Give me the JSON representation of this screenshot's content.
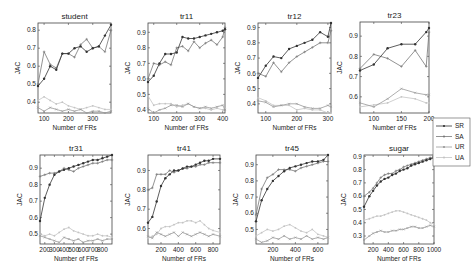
{
  "figure": {
    "series_names": [
      "SR",
      "SA",
      "UR",
      "UA"
    ],
    "series_colors": {
      "SR": "#333333",
      "SA": "#777777",
      "UR": "#999999",
      "UA": "#c4c4c4"
    },
    "xlabel": "Number of FRs",
    "ylabel": "JAC"
  },
  "legend": {
    "items": [
      "SR",
      "SA",
      "UR",
      "UA"
    ]
  },
  "chart_data": [
    {
      "type": "line",
      "title": "student",
      "xlabel": "Number of FRs",
      "ylabel": "JAC",
      "xlim": [
        75,
        375
      ],
      "ylim": [
        0.34,
        0.84
      ],
      "xticks": [
        100,
        200,
        300
      ],
      "yticks": [
        0.4,
        0.5,
        0.6,
        0.7,
        0.8
      ],
      "x": [
        75,
        100,
        125,
        150,
        175,
        200,
        225,
        250,
        275,
        300,
        325,
        350,
        375
      ],
      "series": [
        {
          "name": "SR",
          "values": [
            0.49,
            0.53,
            0.6,
            0.58,
            0.67,
            0.67,
            0.7,
            0.71,
            0.68,
            0.7,
            0.71,
            0.77,
            0.83
          ]
        },
        {
          "name": "SA",
          "values": [
            0.5,
            0.68,
            0.61,
            0.59,
            0.67,
            0.67,
            0.65,
            0.72,
            0.75,
            0.7,
            0.71,
            0.68,
            0.8
          ]
        },
        {
          "name": "UR",
          "values": [
            0.37,
            0.35,
            0.37,
            0.36,
            0.35,
            0.36,
            0.35,
            0.36,
            0.34,
            0.35,
            0.35,
            0.34,
            0.35
          ]
        },
        {
          "name": "UA",
          "values": [
            0.41,
            0.43,
            0.41,
            0.39,
            0.4,
            0.38,
            0.37,
            0.36,
            0.37,
            0.38,
            0.37,
            0.36,
            0.36
          ]
        }
      ]
    },
    {
      "type": "line",
      "title": "tr11",
      "xlabel": "Number of FRs",
      "ylabel": "JAC",
      "xlim": [
        75,
        410
      ],
      "ylim": [
        0.38,
        0.96
      ],
      "xticks": [
        100,
        200,
        300,
        400
      ],
      "yticks": [
        0.4,
        0.5,
        0.6,
        0.7,
        0.8,
        0.9
      ],
      "x": [
        75,
        100,
        125,
        150,
        175,
        200,
        225,
        250,
        275,
        300,
        325,
        350,
        375,
        400,
        410
      ],
      "series": [
        {
          "name": "SR",
          "values": [
            0.58,
            0.62,
            0.7,
            0.76,
            0.76,
            0.77,
            0.87,
            0.86,
            0.86,
            0.87,
            0.88,
            0.89,
            0.9,
            0.91,
            0.92
          ]
        },
        {
          "name": "SA",
          "values": [
            0.6,
            0.7,
            0.69,
            0.71,
            0.69,
            0.8,
            0.81,
            0.78,
            0.84,
            0.8,
            0.83,
            0.85,
            0.82,
            0.87,
            0.93
          ]
        },
        {
          "name": "UR",
          "values": [
            0.41,
            0.38,
            0.4,
            0.41,
            0.43,
            0.43,
            0.42,
            0.44,
            0.42,
            0.41,
            0.42,
            0.41,
            0.42,
            0.43,
            0.4
          ]
        },
        {
          "name": "UA",
          "values": [
            0.49,
            0.43,
            0.44,
            0.44,
            0.44,
            0.42,
            0.43,
            0.44,
            0.42,
            0.41,
            0.41,
            0.4,
            0.41,
            0.4,
            0.41
          ]
        }
      ]
    },
    {
      "type": "line",
      "title": "tr12",
      "xlabel": "Number of FRs",
      "ylabel": "JAC",
      "xlim": [
        75,
        310
      ],
      "ylim": [
        0.34,
        0.93
      ],
      "xticks": [
        100,
        200,
        300
      ],
      "yticks": [
        0.4,
        0.5,
        0.6,
        0.7,
        0.8,
        0.9
      ],
      "x": [
        75,
        100,
        125,
        150,
        175,
        200,
        225,
        250,
        275,
        300,
        310
      ],
      "series": [
        {
          "name": "SR",
          "values": [
            0.57,
            0.65,
            0.71,
            0.7,
            0.76,
            0.78,
            0.8,
            0.82,
            0.87,
            0.84,
            0.93
          ]
        },
        {
          "name": "SA",
          "values": [
            0.6,
            0.58,
            0.67,
            0.61,
            0.67,
            0.71,
            0.74,
            0.77,
            0.8,
            0.8,
            0.88
          ]
        },
        {
          "name": "UR",
          "values": [
            0.42,
            0.41,
            0.38,
            0.39,
            0.4,
            0.4,
            0.38,
            0.37,
            0.37,
            0.39,
            0.38
          ]
        },
        {
          "name": "UA",
          "values": [
            0.44,
            0.42,
            0.39,
            0.39,
            0.39,
            0.36,
            0.37,
            0.36,
            0.36,
            0.34,
            0.34
          ]
        }
      ]
    },
    {
      "type": "line",
      "title": "tr23",
      "xlabel": "Number of FRs",
      "ylabel": "JAC",
      "xlim": [
        75,
        200
      ],
      "ylim": [
        0.52,
        0.97
      ],
      "xticks": [
        100,
        150,
        200
      ],
      "yticks": [
        0.6,
        0.7,
        0.8,
        0.9
      ],
      "x": [
        75,
        100,
        125,
        150,
        175,
        195,
        200
      ],
      "series": [
        {
          "name": "SR",
          "values": [
            0.73,
            0.76,
            0.84,
            0.86,
            0.86,
            0.92,
            0.94
          ]
        },
        {
          "name": "SA",
          "values": [
            0.74,
            0.81,
            0.79,
            0.75,
            0.83,
            0.75,
            0.92
          ]
        },
        {
          "name": "UR",
          "values": [
            0.57,
            0.55,
            0.59,
            0.64,
            0.62,
            0.61,
            0.61
          ]
        },
        {
          "name": "UA",
          "values": [
            0.55,
            0.56,
            0.57,
            0.6,
            0.59,
            0.57,
            0.57
          ]
        }
      ]
    },
    {
      "type": "line",
      "title": "tr31",
      "xlabel": "Number of FRs",
      "ylabel": "JAC",
      "xlim": [
        150,
        900
      ],
      "ylim": [
        0.44,
        0.98
      ],
      "xticks": [
        200,
        300,
        400,
        500,
        600,
        700,
        800
      ],
      "yticks": [
        0.5,
        0.6,
        0.7,
        0.8,
        0.9
      ],
      "x": [
        150,
        200,
        250,
        300,
        350,
        400,
        450,
        500,
        550,
        600,
        650,
        700,
        750,
        800,
        850,
        900
      ],
      "series": [
        {
          "name": "SR",
          "values": [
            0.58,
            0.72,
            0.8,
            0.86,
            0.88,
            0.89,
            0.9,
            0.91,
            0.92,
            0.93,
            0.94,
            0.95,
            0.95,
            0.96,
            0.97,
            0.98
          ]
        },
        {
          "name": "SA",
          "values": [
            0.85,
            0.86,
            0.87,
            0.87,
            0.88,
            0.9,
            0.89,
            0.88,
            0.9,
            0.91,
            0.92,
            0.93,
            0.93,
            0.94,
            0.95,
            0.95
          ]
        },
        {
          "name": "UR",
          "values": [
            0.49,
            0.48,
            0.47,
            0.46,
            0.45,
            0.48,
            0.47,
            0.46,
            0.47,
            0.45,
            0.46,
            0.46,
            0.47,
            0.46,
            0.47,
            0.47
          ]
        },
        {
          "name": "UA",
          "values": [
            0.5,
            0.49,
            0.5,
            0.49,
            0.51,
            0.53,
            0.54,
            0.52,
            0.51,
            0.5,
            0.49,
            0.49,
            0.5,
            0.49,
            0.49,
            0.48
          ]
        }
      ]
    },
    {
      "type": "line",
      "title": "tr41",
      "xlabel": "Number of FRs",
      "ylabel": "JAC",
      "xlim": [
        50,
        880
      ],
      "ylim": [
        0.52,
        0.98
      ],
      "xticks": [
        200,
        400,
        600,
        800
      ],
      "yticks": [
        0.6,
        0.7,
        0.8,
        0.9
      ],
      "x": [
        50,
        100,
        150,
        200,
        250,
        300,
        350,
        400,
        450,
        500,
        550,
        600,
        650,
        700,
        750,
        800,
        880
      ],
      "series": [
        {
          "name": "SR",
          "values": [
            0.63,
            0.66,
            0.74,
            0.82,
            0.86,
            0.88,
            0.9,
            0.9,
            0.91,
            0.92,
            0.92,
            0.93,
            0.94,
            0.95,
            0.95,
            0.96,
            0.96
          ]
        },
        {
          "name": "SA",
          "values": [
            0.8,
            0.81,
            0.88,
            0.88,
            0.88,
            0.9,
            0.89,
            0.9,
            0.91,
            0.91,
            0.92,
            0.92,
            0.93,
            0.93,
            0.94,
            0.94,
            0.94
          ]
        },
        {
          "name": "UR",
          "values": [
            0.56,
            0.55,
            0.58,
            0.57,
            0.56,
            0.57,
            0.58,
            0.56,
            0.58,
            0.57,
            0.56,
            0.57,
            0.58,
            0.57,
            0.56,
            0.57,
            0.56
          ]
        },
        {
          "name": "UA",
          "values": [
            0.55,
            0.56,
            0.57,
            0.6,
            0.61,
            0.61,
            0.62,
            0.63,
            0.63,
            0.64,
            0.64,
            0.63,
            0.64,
            0.62,
            0.6,
            0.59,
            0.58
          ]
        }
      ]
    },
    {
      "type": "line",
      "title": "tr45",
      "xlabel": "Number of FRs",
      "ylabel": "JAC",
      "xlim": [
        50,
        690
      ],
      "ylim": [
        0.41,
        0.96
      ],
      "xticks": [
        200,
        400,
        600
      ],
      "yticks": [
        0.5,
        0.6,
        0.7,
        0.8,
        0.9
      ],
      "x": [
        50,
        100,
        150,
        200,
        250,
        300,
        350,
        400,
        450,
        500,
        550,
        600,
        650,
        690
      ],
      "series": [
        {
          "name": "SR",
          "values": [
            0.55,
            0.68,
            0.75,
            0.8,
            0.83,
            0.86,
            0.88,
            0.89,
            0.9,
            0.91,
            0.92,
            0.92,
            0.93,
            0.96
          ]
        },
        {
          "name": "SA",
          "values": [
            0.59,
            0.75,
            0.82,
            0.84,
            0.87,
            0.87,
            0.87,
            0.86,
            0.88,
            0.89,
            0.9,
            0.91,
            0.92,
            0.92
          ]
        },
        {
          "name": "UR",
          "values": [
            0.44,
            0.42,
            0.43,
            0.45,
            0.44,
            0.46,
            0.44,
            0.45,
            0.44,
            0.46,
            0.44,
            0.45,
            0.44,
            0.45
          ]
        },
        {
          "name": "UA",
          "values": [
            0.46,
            0.48,
            0.5,
            0.49,
            0.5,
            0.52,
            0.53,
            0.51,
            0.49,
            0.48,
            0.5,
            0.47,
            0.46,
            0.45
          ]
        }
      ]
    },
    {
      "type": "line",
      "title": "sugar",
      "xlabel": "Number of FRs",
      "ylabel": "JAC",
      "xlim": [
        80,
        1000
      ],
      "ylim": [
        0.24,
        0.91
      ],
      "xticks": [
        200,
        400,
        600,
        800,
        1000
      ],
      "yticks": [
        0.3,
        0.4,
        0.5,
        0.6,
        0.7,
        0.8,
        0.9
      ],
      "x": [
        80,
        150,
        200,
        250,
        300,
        350,
        400,
        450,
        500,
        550,
        600,
        650,
        700,
        750,
        800,
        850,
        900,
        950,
        1000
      ],
      "series": [
        {
          "name": "SR",
          "values": [
            0.52,
            0.6,
            0.64,
            0.68,
            0.71,
            0.73,
            0.74,
            0.76,
            0.77,
            0.79,
            0.8,
            0.81,
            0.83,
            0.84,
            0.85,
            0.86,
            0.87,
            0.88,
            0.89
          ]
        },
        {
          "name": "SA",
          "values": [
            0.6,
            0.63,
            0.66,
            0.7,
            0.74,
            0.76,
            0.77,
            0.77,
            0.79,
            0.8,
            0.82,
            0.83,
            0.84,
            0.85,
            0.86,
            0.87,
            0.88,
            0.89,
            0.89
          ]
        },
        {
          "name": "UR",
          "values": [
            0.27,
            0.3,
            0.32,
            0.33,
            0.34,
            0.33,
            0.33,
            0.34,
            0.34,
            0.35,
            0.35,
            0.36,
            0.37,
            0.37,
            0.36,
            0.36,
            0.37,
            0.38,
            0.37
          ]
        },
        {
          "name": "UA",
          "values": [
            0.42,
            0.43,
            0.44,
            0.45,
            0.45,
            0.46,
            0.47,
            0.48,
            0.49,
            0.49,
            0.48,
            0.47,
            0.46,
            0.45,
            0.44,
            0.43,
            0.42,
            0.4,
            0.39
          ]
        }
      ]
    }
  ]
}
